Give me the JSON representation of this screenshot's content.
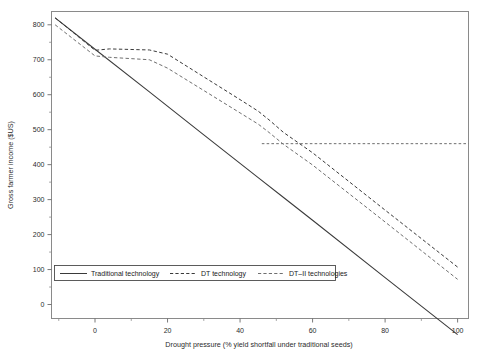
{
  "chart_data": {
    "type": "line",
    "title": "",
    "xlabel": "Drought pressure (% yield shortfall under traditional seeds)",
    "ylabel": "Gross farmer income ($US)",
    "xlim": [
      -12,
      103
    ],
    "ylim": [
      -40,
      838
    ],
    "xticks": [
      0,
      20,
      40,
      60,
      80,
      100
    ],
    "xtick_labels": [
      "0",
      "20",
      "40",
      "60",
      "80",
      "100"
    ],
    "yticks": [
      0,
      100,
      200,
      300,
      400,
      500,
      600,
      700,
      800
    ],
    "ytick_labels": [
      "0",
      "100",
      "200",
      "300",
      "400",
      "500",
      "600",
      "700",
      "800"
    ],
    "grid": false,
    "legend_position": "lower-left",
    "series": [
      {
        "name": "Traditional technology",
        "style": "solid",
        "color": "#3a3a3a",
        "x": [
          -11,
          0,
          15,
          30,
          45,
          52,
          60,
          80,
          100
        ],
        "y": [
          820,
          730,
          608,
          485,
          363,
          306,
          241,
          77,
          -86
        ]
      },
      {
        "name": "DT technology",
        "style": "dashed",
        "color": "#3a3a3a",
        "x": [
          -11,
          0,
          4,
          15,
          20,
          30,
          40,
          45,
          48,
          52,
          60,
          80,
          100
        ],
        "y": [
          820,
          727,
          731,
          728,
          716,
          651,
          586,
          553,
          528,
          492,
          434,
          270,
          107
        ]
      },
      {
        "name": "DT–II technologies",
        "style": "dashed",
        "color": "#6f6f6f",
        "x": [
          -11,
          0,
          4,
          15,
          20,
          30,
          40,
          45,
          48,
          52,
          60,
          80,
          100
        ],
        "y": [
          800,
          711,
          707,
          700,
          676,
          612,
          548,
          516,
          492,
          458,
          399,
          236,
          72
        ]
      }
    ],
    "reference_lines": [
      {
        "name": "income-floor",
        "orientation": "horizontal",
        "value": 460,
        "x_start": 46,
        "x_end": 103,
        "style": "dashed",
        "color": "#6f6f6f"
      }
    ],
    "legend_entries": [
      {
        "label": "Traditional technology",
        "style": "solid",
        "color": "#3a3a3a"
      },
      {
        "label": "DT technology",
        "style": "dashed",
        "color": "#3a3a3a"
      },
      {
        "label": "DT–II technologies",
        "style": "dashed",
        "color": "#6f6f6f"
      }
    ]
  }
}
